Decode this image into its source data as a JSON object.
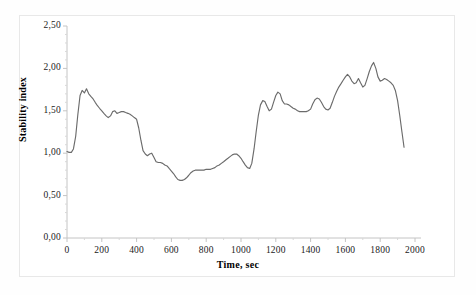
{
  "chart_data": {
    "type": "line",
    "title": "",
    "xlabel": "Time, sec",
    "ylabel": "Stability index",
    "xlim": [
      0,
      2000
    ],
    "ylim": [
      0,
      2.5
    ],
    "grid": false,
    "legend": null,
    "line_color": "#6b6b6b",
    "axis_color": "#bfbfbf",
    "xticks": [
      0,
      200,
      400,
      600,
      800,
      1000,
      1200,
      1400,
      1600,
      1800,
      2000
    ],
    "xticklabels": [
      "0",
      "200",
      "400",
      "600",
      "800",
      "1000",
      "1200",
      "1400",
      "1600",
      "1800",
      "2000"
    ],
    "yticks": [
      0.0,
      0.5,
      1.0,
      1.5,
      2.0,
      2.5
    ],
    "yticklabels": [
      "0,00",
      "0,50",
      "1,00",
      "1,50",
      "2,00",
      "2,50"
    ],
    "x": [
      0,
      12,
      25,
      37,
      50,
      62,
      75,
      87,
      100,
      112,
      125,
      137,
      150,
      162,
      175,
      187,
      200,
      212,
      225,
      237,
      250,
      262,
      275,
      287,
      300,
      312,
      325,
      337,
      350,
      362,
      375,
      387,
      400,
      412,
      425,
      437,
      450,
      462,
      475,
      487,
      500,
      512,
      525,
      537,
      550,
      562,
      575,
      587,
      600,
      612,
      625,
      637,
      650,
      662,
      675,
      687,
      700,
      712,
      725,
      737,
      750,
      762,
      775,
      787,
      800,
      812,
      825,
      837,
      850,
      862,
      875,
      887,
      900,
      912,
      925,
      937,
      950,
      962,
      975,
      987,
      1000,
      1012,
      1025,
      1037,
      1050,
      1062,
      1075,
      1087,
      1100,
      1112,
      1125,
      1137,
      1150,
      1162,
      1175,
      1187,
      1200,
      1212,
      1225,
      1237,
      1250,
      1262,
      1275,
      1287,
      1300,
      1312,
      1325,
      1337,
      1350,
      1362,
      1375,
      1387,
      1400,
      1412,
      1425,
      1437,
      1450,
      1462,
      1475,
      1487,
      1500,
      1512,
      1525,
      1537,
      1550,
      1562,
      1575,
      1587,
      1600,
      1612,
      1625,
      1637,
      1650,
      1662,
      1675,
      1687,
      1700,
      1712,
      1725,
      1737,
      1750,
      1762,
      1775,
      1787,
      1800,
      1812,
      1825,
      1837,
      1850,
      1862,
      1875,
      1887,
      1900,
      1912,
      1925,
      1937,
      1950,
      1962,
      1975,
      1987,
      2000
    ],
    "y": [
      1.02,
      1.01,
      1.01,
      1.05,
      1.2,
      1.45,
      1.68,
      1.74,
      1.71,
      1.76,
      1.7,
      1.67,
      1.64,
      1.6,
      1.56,
      1.53,
      1.5,
      1.47,
      1.44,
      1.42,
      1.44,
      1.49,
      1.5,
      1.47,
      1.48,
      1.49,
      1.49,
      1.48,
      1.47,
      1.46,
      1.44,
      1.42,
      1.4,
      1.3,
      1.15,
      1.03,
      0.99,
      0.97,
      0.99,
      1.0,
      0.95,
      0.9,
      0.89,
      0.89,
      0.88,
      0.86,
      0.85,
      0.82,
      0.79,
      0.76,
      0.72,
      0.69,
      0.68,
      0.68,
      0.69,
      0.71,
      0.74,
      0.77,
      0.79,
      0.8,
      0.8,
      0.8,
      0.8,
      0.8,
      0.81,
      0.81,
      0.81,
      0.82,
      0.83,
      0.85,
      0.86,
      0.88,
      0.9,
      0.92,
      0.94,
      0.96,
      0.98,
      0.99,
      0.99,
      0.97,
      0.94,
      0.9,
      0.86,
      0.83,
      0.82,
      0.88,
      1.05,
      1.25,
      1.45,
      1.57,
      1.62,
      1.61,
      1.55,
      1.5,
      1.52,
      1.6,
      1.68,
      1.72,
      1.7,
      1.62,
      1.58,
      1.58,
      1.57,
      1.55,
      1.53,
      1.52,
      1.5,
      1.49,
      1.49,
      1.49,
      1.49,
      1.5,
      1.52,
      1.58,
      1.63,
      1.65,
      1.64,
      1.6,
      1.55,
      1.52,
      1.51,
      1.53,
      1.6,
      1.67,
      1.73,
      1.78,
      1.82,
      1.86,
      1.9,
      1.93,
      1.9,
      1.85,
      1.82,
      1.83,
      1.88,
      1.83,
      1.78,
      1.8,
      1.88,
      1.96,
      2.03,
      2.07,
      2.0,
      1.9,
      1.85,
      1.86,
      1.88,
      1.87,
      1.85,
      1.83,
      1.8,
      1.74,
      1.62,
      1.45,
      1.25,
      1.07
    ]
  }
}
